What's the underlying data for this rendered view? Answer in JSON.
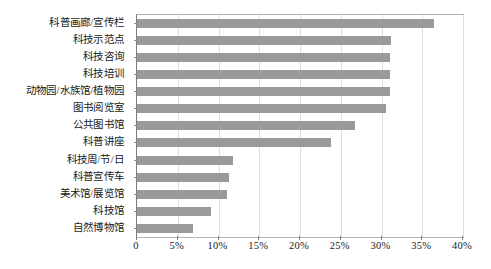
{
  "chart_data": {
    "type": "bar",
    "orientation": "horizontal",
    "title": "",
    "subtitle": "",
    "xlabel": "",
    "ylabel": "",
    "xlim": [
      0,
      40
    ],
    "xunit": "%",
    "grid": true,
    "legend": false,
    "legend_position": "none",
    "bar_color": "#9a9a9a",
    "plot_border_color": "#b5b5b5",
    "gridline_color": "#dedede",
    "axis_tick_labels": [
      "0",
      "5%",
      "10%",
      "15%",
      "20%",
      "25%",
      "30%",
      "35%",
      "40%"
    ],
    "axis_tick_values": [
      0,
      5,
      10,
      15,
      20,
      25,
      30,
      35,
      40
    ],
    "categories": [
      "科普画廊/宣传栏",
      "科技示范点",
      "科技咨询",
      "科技培训",
      "动物园/水族馆/植物园",
      "图书阅览室",
      "公共图书馆",
      "科普讲座",
      "科技周/节/日",
      "科普宣传车",
      "美术馆/展览馆",
      "科技馆",
      "自然博物馆"
    ],
    "values": [
      36.5,
      31.2,
      31.0,
      31.0,
      31.0,
      30.5,
      26.8,
      23.8,
      11.8,
      11.3,
      11.0,
      9.1,
      6.9
    ]
  }
}
